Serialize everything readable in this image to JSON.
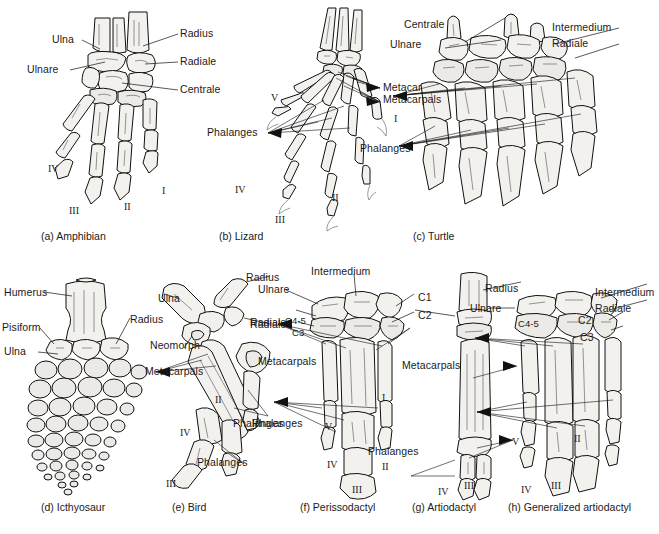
{
  "figure": {
    "background_color": "#ffffff",
    "ink_color": "#111111",
    "bone_fill_color": "#f3f1ee"
  },
  "panels": [
    {
      "key": "a",
      "caption": "(a) Amphibian",
      "labels": [
        {
          "name": "ulna",
          "text": "Ulna"
        },
        {
          "name": "radius",
          "text": "Radius"
        },
        {
          "name": "ulnare",
          "text": "Ulnare"
        },
        {
          "name": "radiale",
          "text": "Radiale"
        },
        {
          "name": "centrale",
          "text": "Centrale"
        }
      ],
      "digits": [
        "IV",
        "III",
        "II",
        "I"
      ]
    },
    {
      "key": "b",
      "caption": "(b) Lizard",
      "labels": [
        {
          "name": "metacarpals",
          "text": "Metacarpals"
        },
        {
          "name": "phalanges",
          "text": "Phalanges"
        }
      ],
      "digits": [
        "V",
        "IV",
        "III",
        "II",
        "I"
      ]
    },
    {
      "key": "c",
      "caption": "(c) Turtle",
      "labels": [
        {
          "name": "centrale",
          "text": "Centrale"
        },
        {
          "name": "ulnare",
          "text": "Ulnare"
        },
        {
          "name": "intermedium",
          "text": "Intermedium"
        },
        {
          "name": "radiale",
          "text": "Radiale"
        },
        {
          "name": "metacarpals",
          "text": "Metacarpals"
        },
        {
          "name": "phalanges",
          "text": "Phalanges"
        }
      ],
      "digits": []
    },
    {
      "key": "d",
      "caption": "(d) Icthyosaur",
      "labels": [
        {
          "name": "humerus",
          "text": "Humerus"
        },
        {
          "name": "pisiform",
          "text": "Pisiform"
        },
        {
          "name": "ulna",
          "text": "Ulna"
        },
        {
          "name": "radius",
          "text": "Radius"
        }
      ],
      "digits": []
    },
    {
      "key": "e",
      "caption": "(e) Bird",
      "labels": [
        {
          "name": "ulna",
          "text": "Ulna"
        },
        {
          "name": "radius",
          "text": "Radius"
        },
        {
          "name": "radiale",
          "text": "Radiale"
        },
        {
          "name": "neomorph",
          "text": "Neomorph"
        },
        {
          "name": "metacarpals",
          "text": "Metacarpals"
        },
        {
          "name": "phalanges-upper",
          "text": "Phalanges"
        },
        {
          "name": "phalanges-lower",
          "text": "Phalanges"
        }
      ],
      "digits": [
        "II",
        "III",
        "IV"
      ]
    },
    {
      "key": "f",
      "caption": "(f) Perissodactyl",
      "labels": [
        {
          "name": "intermedium",
          "text": "Intermedium"
        },
        {
          "name": "ulnare",
          "text": "Ulnare"
        },
        {
          "name": "radiale",
          "text": "Radiale"
        },
        {
          "name": "carpal-4-5",
          "text": "C4-5"
        },
        {
          "name": "carpal-3",
          "text": "C3"
        },
        {
          "name": "carpal-1",
          "text": "C1"
        },
        {
          "name": "carpal-2",
          "text": "C2"
        },
        {
          "name": "metacarpals",
          "text": "Metacarpals"
        },
        {
          "name": "phalanges",
          "text": "Phalanges"
        }
      ],
      "digits": [
        "V",
        "IV",
        "III",
        "II",
        "I"
      ]
    },
    {
      "key": "g",
      "caption": "(g) Artiodactyl",
      "labels": [
        {
          "name": "radius",
          "text": "Radius"
        },
        {
          "name": "ulnare",
          "text": "Ulnare"
        },
        {
          "name": "metacarpals",
          "text": "Metacarpals"
        },
        {
          "name": "phalanges",
          "text": "Phalanges"
        }
      ],
      "digits": [
        "IV",
        "III"
      ]
    },
    {
      "key": "h",
      "caption": "(h) Generalized artiodactyl",
      "labels": [
        {
          "name": "intermedium",
          "text": "Intermedium"
        },
        {
          "name": "radiale",
          "text": "Radiale"
        },
        {
          "name": "carpal-4-5",
          "text": "C4-5"
        },
        {
          "name": "carpal-2",
          "text": "C2"
        },
        {
          "name": "carpal-3",
          "text": "C3"
        }
      ],
      "digits": [
        "V",
        "II",
        "IV",
        "III"
      ]
    }
  ]
}
